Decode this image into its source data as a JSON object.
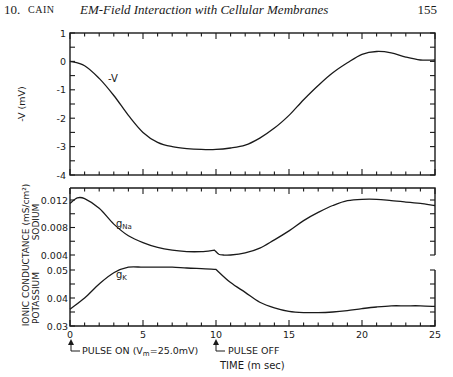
{
  "header": {
    "chapter_number": "10.",
    "author": "CAIN",
    "running_title": "EM-Field Interaction with Cellular Membranes",
    "page_number": "155"
  },
  "chart_data": [
    {
      "type": "line",
      "panel": "top",
      "title": "",
      "xlabel": "TIME (m sec)",
      "ylabel": "-V (mV)",
      "xlim": [
        0,
        25
      ],
      "ylim": [
        -4,
        1
      ],
      "x_ticks": [
        0,
        5,
        10,
        15,
        20,
        25
      ],
      "y_ticks": [
        "1",
        "0",
        "-1",
        "-2",
        "-3",
        "-4"
      ],
      "grid": false,
      "series": [
        {
          "name": "-V",
          "x": [
            0,
            1,
            2,
            3,
            4,
            5,
            6,
            7,
            8,
            9,
            10,
            11,
            12,
            13,
            14,
            15,
            16,
            17,
            18,
            19,
            20,
            21,
            22,
            23,
            24,
            25
          ],
          "values": [
            0,
            -0.15,
            -0.6,
            -1.2,
            -1.9,
            -2.5,
            -2.85,
            -3.0,
            -3.07,
            -3.1,
            -3.1,
            -3.05,
            -2.95,
            -2.7,
            -2.35,
            -1.9,
            -1.35,
            -0.85,
            -0.4,
            -0.05,
            0.25,
            0.35,
            0.3,
            0.15,
            0.05,
            0.05
          ]
        }
      ]
    },
    {
      "type": "line",
      "panel": "bottom",
      "title": "",
      "xlabel": "TIME (m sec)",
      "ylabel": "IONIC CONDUCTANCE (mS/cm²)",
      "sublabels": [
        "SODIUM",
        "POTASSIUM"
      ],
      "xlim": [
        0,
        25
      ],
      "sodium_ylim": [
        0.004,
        0.014
      ],
      "sodium_y_ticks": [
        "0.012",
        "0.008",
        "0.004"
      ],
      "potassium_ylim": [
        0.03,
        0.05
      ],
      "potassium_y_ticks": [
        "0.05",
        "0.04",
        "0.03"
      ],
      "x_ticks": [
        "0",
        "5",
        "10",
        "15",
        "20",
        "25"
      ],
      "grid": false,
      "series": [
        {
          "name": "gNa",
          "x": [
            0,
            0.5,
            1,
            2,
            3,
            4,
            5,
            6,
            7,
            8,
            9,
            9.9,
            10.2,
            10.5,
            11,
            12,
            13,
            14,
            15,
            16,
            17,
            18,
            19,
            20,
            21,
            22,
            23,
            24,
            25
          ],
          "values": [
            0.0115,
            0.0123,
            0.0122,
            0.0108,
            0.0085,
            0.0068,
            0.0058,
            0.0051,
            0.0047,
            0.0045,
            0.0045,
            0.0047,
            0.0041,
            0.004,
            0.004,
            0.0043,
            0.005,
            0.0062,
            0.0075,
            0.009,
            0.0102,
            0.0112,
            0.0119,
            0.0121,
            0.0121,
            0.0119,
            0.0117,
            0.0115,
            0.0112
          ]
        },
        {
          "name": "gK",
          "x": [
            0,
            1,
            2,
            3,
            4,
            5,
            6,
            7,
            8,
            9,
            10,
            11,
            12,
            13,
            14,
            15,
            16,
            17,
            18,
            19,
            20,
            21,
            22,
            23,
            24,
            25
          ],
          "values": [
            0.036,
            0.04,
            0.045,
            0.049,
            0.051,
            0.051,
            0.051,
            0.051,
            0.0507,
            0.0505,
            0.0502,
            0.0455,
            0.042,
            0.0385,
            0.0365,
            0.0352,
            0.0348,
            0.0348,
            0.035,
            0.0355,
            0.0362,
            0.0368,
            0.0372,
            0.0372,
            0.0372,
            0.037
          ]
        }
      ]
    }
  ],
  "labels": {
    "v_curve": "-V",
    "top_ylabel": "-V (mV)",
    "bottom_ylabel": "IONIC  CONDUCTANCE (mS/cm²)",
    "sodium_label": "SODIUM",
    "potassium_label": "POTASSIUM",
    "gna_main": "g",
    "gna_sub": "Na",
    "gk_main": "g",
    "gk_sub": "K",
    "xlabel": "TIME (m sec)",
    "pulse_on": "PULSE ON (V",
    "pulse_on_sub": "m",
    "pulse_on_tail": "=25.0mV)",
    "pulse_off": "PULSE OFF"
  },
  "ticks": {
    "top_y": [
      "1",
      "0",
      "-1",
      "-2",
      "-3",
      "-4"
    ],
    "na_y": [
      "0.012",
      "0.008",
      "0.004"
    ],
    "k_y": [
      "0.05",
      "0.04",
      "0.03"
    ],
    "x": [
      "0",
      "5",
      "10",
      "15",
      "20",
      "25"
    ]
  }
}
